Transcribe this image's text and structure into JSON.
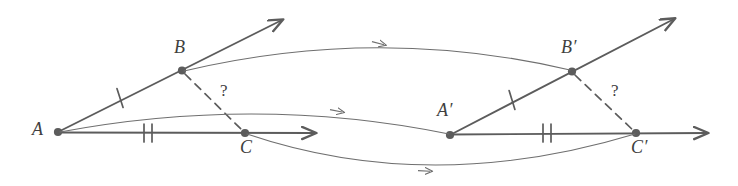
{
  "figure": {
    "stroke_color": "#5c5c5c",
    "label_color": "#3f3f3f",
    "background": "#ffffff"
  },
  "labels": {
    "A": "A",
    "B": "B",
    "C": "C",
    "A_prime": "A′",
    "B_prime": "B′",
    "C_prime": "C′",
    "question_left": "?",
    "question_right": "?"
  },
  "points": {
    "A": {
      "x": 58,
      "y": 132
    },
    "B": {
      "x": 182,
      "y": 70
    },
    "C": {
      "x": 245,
      "y": 133
    },
    "A_prime": {
      "x": 450,
      "y": 135
    },
    "B_prime": {
      "x": 572,
      "y": 71
    },
    "C_prime": {
      "x": 636,
      "y": 133
    }
  },
  "rays": [
    {
      "name": "ray-AB",
      "from": "A",
      "through": "B",
      "tip_x": 286,
      "tip_y": 14
    },
    {
      "name": "ray-AC",
      "from": "A",
      "through": "C",
      "tip_x": 321,
      "tip_y": 133
    },
    {
      "name": "ray-ApBp",
      "from": "A_prime",
      "through": "B_prime",
      "tip_x": 678,
      "tip_y": 13
    },
    {
      "name": "ray-ApCp",
      "from": "A_prime",
      "through": "C_prime",
      "tip_x": 713,
      "tip_y": 133
    }
  ],
  "dashed_segments": [
    {
      "name": "segment-BC",
      "from": "B",
      "to": "C"
    },
    {
      "name": "segment-BpCp",
      "from": "B_prime",
      "to": "C_prime"
    }
  ],
  "tick_marks": [
    {
      "name": "tick-AB",
      "count": 1,
      "x": 120,
      "y": 98
    },
    {
      "name": "tick-AC",
      "count": 2,
      "x": 148,
      "y": 133
    },
    {
      "name": "tick-ApBp",
      "count": 1,
      "x": 512,
      "y": 100
    },
    {
      "name": "tick-ApCp",
      "count": 2,
      "x": 547,
      "y": 133
    }
  ],
  "correspondence_arrows": [
    {
      "name": "arrow-B-to-Bprime",
      "from": "B",
      "to": "B_prime",
      "curve": "up",
      "arrow_at_x": 375
    },
    {
      "name": "arrow-A-to-Aprime",
      "from": "A",
      "to": "A_prime",
      "curve": "up",
      "arrow_at_x": 335
    },
    {
      "name": "arrow-C-to-Cprime",
      "from": "C",
      "to": "C_prime",
      "curve": "down",
      "arrow_at_x": 425
    }
  ]
}
